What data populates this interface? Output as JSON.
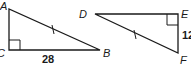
{
  "diagram": {
    "title": "",
    "triangles": [
      {
        "name": "ABC",
        "vertices": {
          "A": "A",
          "B": "B",
          "C": "C"
        },
        "right_angle_at": "C",
        "side_labels": {
          "CB": "28"
        },
        "congruence_mark": "AB"
      },
      {
        "name": "DEF",
        "vertices": {
          "D": "D",
          "E": "E",
          "F": "F"
        },
        "right_angle_at": "E",
        "side_labels": {
          "EF": "12"
        },
        "congruence_mark": "DF"
      }
    ],
    "colors": {
      "stroke": "#1a1a1a",
      "background": "#ffffff"
    }
  }
}
